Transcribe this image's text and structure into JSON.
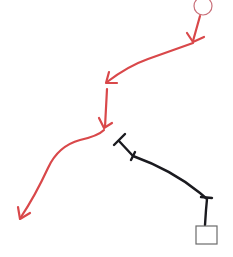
{
  "diagram": {
    "width": 233,
    "height": 257,
    "background": "#ffffff",
    "colors": {
      "red_path": "#d9484a",
      "circle_stroke": "#c9707a",
      "black_path": "#1a1a1f",
      "square_stroke": "#6b6b6b"
    },
    "nodes": [
      {
        "id": "start-circle",
        "shape": "circle",
        "cx": 203,
        "cy": 6,
        "r": 9
      },
      {
        "id": "end-square",
        "shape": "square",
        "x": 196,
        "y": 226,
        "w": 21,
        "h": 18
      }
    ],
    "red_segments": [
      {
        "id": "red-seg-1",
        "d": "M 200 16 L 193 41"
      },
      {
        "id": "red-seg-2",
        "d": "M 193 43 L 148 59 Q 128 66 107 82"
      },
      {
        "id": "red-seg-3",
        "d": "M 107 89 L 105 127"
      },
      {
        "id": "red-seg-4",
        "d": "M 104 130 Q 98 136 80 140 Q 58 146 48 168 Q 35 196 21 217"
      }
    ],
    "red_arrowheads": [
      {
        "id": "arrowhead-1",
        "d": "M 187 33 L 193 42 L 204 37"
      },
      {
        "id": "arrowhead-2",
        "d": "M 109 72 L 106 83 L 117 83"
      },
      {
        "id": "arrowhead-3",
        "d": "M 99 118 L 104 128 L 112 123"
      },
      {
        "id": "arrowhead-4",
        "d": "M 18 207 L 20 219 L 30 213"
      }
    ],
    "black_path": {
      "id": "black-connector",
      "d": "M 119 141 L 133 156 Q 172 170 200 193 L 207 199 L 206 210 L 205 225",
      "end_caps": [
        {
          "id": "t-cap-top",
          "d": "M 114 145 L 125 134"
        },
        {
          "id": "tick-1",
          "d": "M 131 160 L 135 152"
        },
        {
          "id": "tick-2",
          "d": "M 201 197 L 212 198"
        }
      ]
    }
  }
}
